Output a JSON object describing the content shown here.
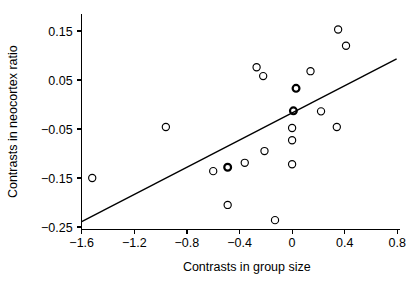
{
  "chart_data": {
    "type": "scatter",
    "title": "",
    "xlabel": "Contrasts in group size",
    "ylabel": "Contrasts in neocortex ratio",
    "xlim": [
      -1.75,
      0.82
    ],
    "ylim": [
      -0.255,
      0.185
    ],
    "xticks": [
      -1.6,
      -1.2,
      -0.8,
      -0.4,
      0,
      0.4,
      0.8
    ],
    "xticklabels": [
      "-1.6",
      "-1.2",
      "-0.8",
      "-0.4",
      "0",
      "0.4",
      "0.8"
    ],
    "yticks": [
      0.15,
      0.05,
      -0.05,
      -0.15,
      -0.25
    ],
    "yticklabels": [
      "0.15",
      "0.05",
      "-0.05",
      "-0.15",
      "-0.25"
    ],
    "grid": false,
    "legend": null,
    "marker": "open-circle",
    "points": [
      {
        "x": -1.52,
        "y": -0.15,
        "emphasis": false
      },
      {
        "x": -0.96,
        "y": -0.046,
        "emphasis": false
      },
      {
        "x": -0.6,
        "y": -0.136,
        "emphasis": false
      },
      {
        "x": -0.49,
        "y": -0.128,
        "emphasis": true
      },
      {
        "x": -0.49,
        "y": -0.205,
        "emphasis": false
      },
      {
        "x": -0.36,
        "y": -0.119,
        "emphasis": false
      },
      {
        "x": -0.27,
        "y": 0.076,
        "emphasis": false
      },
      {
        "x": -0.22,
        "y": 0.058,
        "emphasis": false
      },
      {
        "x": -0.21,
        "y": -0.095,
        "emphasis": false
      },
      {
        "x": -0.13,
        "y": -0.236,
        "emphasis": false
      },
      {
        "x": 0.0,
        "y": -0.048,
        "emphasis": false
      },
      {
        "x": 0.0,
        "y": -0.073,
        "emphasis": false
      },
      {
        "x": 0.0,
        "y": -0.122,
        "emphasis": false
      },
      {
        "x": 0.01,
        "y": -0.013,
        "emphasis": true
      },
      {
        "x": 0.03,
        "y": 0.033,
        "emphasis": true
      },
      {
        "x": 0.14,
        "y": 0.068,
        "emphasis": false
      },
      {
        "x": 0.22,
        "y": -0.014,
        "emphasis": false
      },
      {
        "x": 0.34,
        "y": -0.046,
        "emphasis": false
      },
      {
        "x": 0.35,
        "y": 0.153,
        "emphasis": false
      },
      {
        "x": 0.41,
        "y": 0.12,
        "emphasis": false
      }
    ],
    "fit_line": {
      "x0": -1.6,
      "y0": -0.239,
      "x1": 0.795,
      "y1": 0.093
    }
  }
}
